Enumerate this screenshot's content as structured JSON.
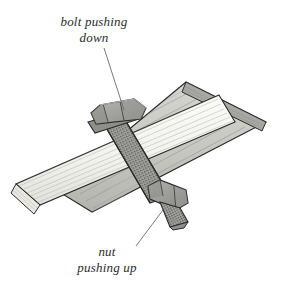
{
  "figure": {
    "background_color": "#ffffff",
    "line_color": "#2b2b2b",
    "label_text_color": "#2b2b2b"
  },
  "annotations": {
    "bolt": {
      "line1": "bolt pushing",
      "line2": "down",
      "full_text": "bolt pushing down",
      "leader_from": [
        104,
        48
      ],
      "leader_to": [
        124,
        110
      ]
    },
    "nut": {
      "line1": "nut",
      "line2": "pushing up",
      "full_text": "nut pushing up",
      "leader_from": [
        136,
        246
      ],
      "leader_to": [
        163,
        210
      ]
    }
  },
  "parts": [
    {
      "name": "upper-plank",
      "label": "dark wooden plank",
      "fill_color": "#c9c9c4",
      "edge_color": "#2b2b2b",
      "grain_color": "#8d8d88",
      "orientation": "upper-right to lower-left"
    },
    {
      "name": "lower-plank",
      "label": "light wooden plank",
      "fill_color": "#f2f2ee",
      "edge_color": "#2b2b2b",
      "grain_color": "#b6b6b0",
      "orientation": "upper-right to lower-left, shallow"
    },
    {
      "name": "bolt-head",
      "label": "hex bolt head",
      "fill_color": "#9d9d9a",
      "edge_color": "#2b2b2b"
    },
    {
      "name": "washer",
      "label": "flat washer",
      "fill_color": "#8e8e8b",
      "edge_color": "#2b2b2b"
    },
    {
      "name": "bolt-shaft",
      "label": "threaded bolt shaft",
      "fill_color": "#a8a8a4",
      "edge_color": "#2b2b2b",
      "texture": "stippled threads"
    },
    {
      "name": "hex-nut",
      "label": "hex nut",
      "fill_color": "#9a9a97",
      "edge_color": "#2b2b2b"
    },
    {
      "name": "bolt-tip",
      "label": "protruding threaded bolt tip",
      "fill_color": "#a5a5a1",
      "edge_color": "#2b2b2b",
      "texture": "stippled threads"
    }
  ]
}
